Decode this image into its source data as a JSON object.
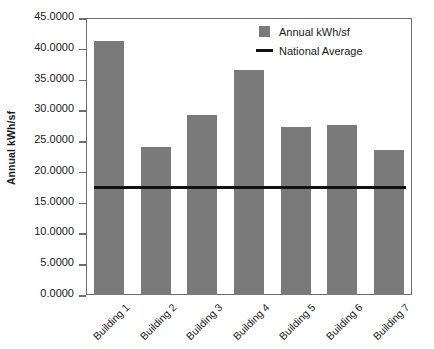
{
  "chart_data": {
    "type": "bar",
    "title": "",
    "xlabel": "",
    "ylabel": "Annual kWh/sf",
    "ylim": [
      0,
      45
    ],
    "ytick_step": 5,
    "grid": false,
    "legend_position": "top-right",
    "categories": [
      "Building 1",
      "Building 2",
      "Building 3",
      "Building 4",
      "Building 5",
      "Building 6",
      "Building 7"
    ],
    "series": [
      {
        "name": "Annual kWh/sf",
        "type": "bar",
        "color": "#7a7a7a",
        "values": [
          41.3,
          24.0,
          29.2,
          36.6,
          27.3,
          27.6,
          23.6
        ]
      },
      {
        "name": "National Average",
        "type": "threshold-line",
        "color": "#111111",
        "value": 17.4
      }
    ],
    "ytick_labels": [
      "0.0000",
      "5.0000",
      "10.0000",
      "15.0000",
      "20.0000",
      "25.0000",
      "30.0000",
      "35.0000",
      "40.0000",
      "45.0000"
    ],
    "ytick_values": [
      0,
      5,
      10,
      15,
      20,
      25,
      30,
      35,
      40,
      45
    ]
  },
  "legend": {
    "items": [
      {
        "label": "Annual kWh/sf",
        "marker": "square-swatch-icon",
        "color": "#7a7a7a"
      },
      {
        "label": "National Average",
        "marker": "line-swatch-icon",
        "color": "#111111"
      }
    ]
  },
  "axis": {
    "y_title": "Annual kWh/sf"
  },
  "colors": {
    "bar": "#7a7a7a",
    "line": "#111111",
    "frame": "#6d6d6d",
    "background": "#ffffff"
  }
}
